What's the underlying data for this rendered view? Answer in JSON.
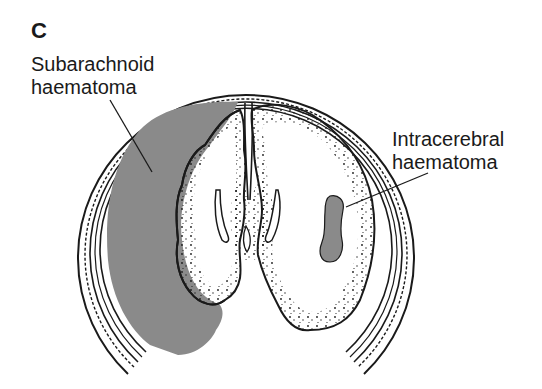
{
  "figure": {
    "panel_label": "C",
    "labels": {
      "subarachnoid": {
        "line1": "Subarachnoid",
        "line2": "haematoma"
      },
      "intracerebral": {
        "line1": "Intracerebral",
        "line2": "haematoma"
      }
    },
    "colors": {
      "haematoma_fill": "#8a8a8a",
      "outline": "#1a1a1a",
      "background": "#ffffff"
    }
  }
}
